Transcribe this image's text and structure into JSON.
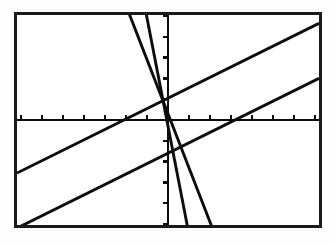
{
  "app": {
    "title": "Graphing Calculator Screen",
    "screen_label": "calculator-graph-display"
  },
  "screen": {
    "frame_color": "#1a1a1a",
    "background_color": "#ffffff",
    "plot_color": "#0d0d0d",
    "width_px": 308,
    "height_px": 216
  },
  "chart_data": {
    "type": "line",
    "title": "",
    "xlabel": "",
    "ylabel": "",
    "xlim": [
      -7.2,
      7.2
    ],
    "ylim": [
      -5.05,
      5.05
    ],
    "grid": false,
    "legend": "none",
    "axes": {
      "x_axis_y": 0,
      "y_axis_x": 0,
      "x_tick_step": 1,
      "y_tick_step": 1,
      "x_ticks": [
        -7,
        -6,
        -5,
        -4,
        -3,
        -2,
        -1,
        1,
        2,
        3,
        4,
        5,
        6,
        7
      ],
      "y_ticks": [
        -5,
        -4,
        -3,
        -2,
        -1,
        1,
        2,
        3,
        4,
        5
      ],
      "tick_length_px": 5
    },
    "series": [
      {
        "name": "line-1-shallow-positive",
        "slope": 0.5,
        "intercept": 1.05,
        "points": [
          [
            -7.2,
            -2.55
          ],
          [
            7.2,
            4.65
          ]
        ],
        "style": "solid"
      },
      {
        "name": "line-2-shallow-positive-lower",
        "slope": 0.5,
        "intercept": -1.6,
        "points": [
          [
            -7.2,
            -5.2
          ],
          [
            7.2,
            2.0
          ]
        ],
        "style": "solid"
      },
      {
        "name": "line-3-steep-negative-left",
        "slope": -2.6,
        "intercept": 0.3,
        "points": [
          [
            -2.0,
            5.5
          ],
          [
            2.3,
            -5.68
          ]
        ],
        "style": "solid"
      },
      {
        "name": "line-4-steep-negative-right",
        "slope": -5.2,
        "intercept": -0.3,
        "points": [
          [
            -1.15,
            5.68
          ],
          [
            1.02,
            -5.6
          ]
        ],
        "style": "solid"
      }
    ],
    "intersections": [
      {
        "label": "upper-left-crossing",
        "x": -1.4,
        "y": 0.35
      },
      {
        "label": "lower-right-crossing",
        "x": 0.55,
        "y": -1.32
      }
    ]
  }
}
